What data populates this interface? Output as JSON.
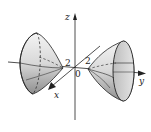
{
  "figure": {
    "type": "hyperboloid-of-two-sheets",
    "axes": {
      "x_label": "x",
      "y_label": "y",
      "z_label": "z",
      "origin_label": "0"
    },
    "annotations": {
      "left_vertex_label": "2",
      "right_vertex_label": "2"
    },
    "colors": {
      "line": "#222222",
      "shade_light": "#eeeeee",
      "shade_dark": "#9a9a9a",
      "background": "#ffffff"
    }
  }
}
